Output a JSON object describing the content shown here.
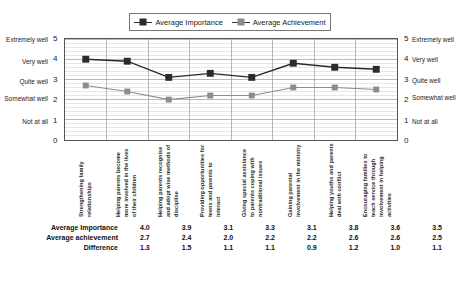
{
  "chart_data": {
    "type": "line",
    "title": "",
    "xlabel": "",
    "ylabel": "",
    "ylim": [
      0,
      5
    ],
    "grid": true,
    "legend_position": "top",
    "categories": [
      "Strengthening family relationships",
      "Helping parents become more involved in the lives of their children",
      "Helping parents recognise and adopt wise methods of discipline",
      "Providing opportunities for teens and parents to interact",
      "Giving special assistance to parents coping with nontraditional issues",
      "Gaining parental involvement in the ministry",
      "Helping youths and parents deal with conflict",
      "Encouraging families to teach service through involvement in helping activities"
    ],
    "series": [
      {
        "name": "Average Importance",
        "values": [
          4.0,
          3.9,
          3.1,
          3.3,
          3.1,
          3.8,
          3.6,
          3.5
        ],
        "color": "#2b2b2b"
      },
      {
        "name": "Average Achievement",
        "values": [
          2.7,
          2.4,
          2.0,
          2.2,
          2.2,
          2.6,
          2.6,
          2.5
        ],
        "color": "#8c8c8c"
      }
    ],
    "y_ticks": [
      {
        "value": 5,
        "number": "5",
        "label": "Extremely well"
      },
      {
        "value": 4,
        "number": "4",
        "label": "Very well"
      },
      {
        "value": 3,
        "number": "3",
        "label": "Quite well"
      },
      {
        "value": 2,
        "number": "2",
        "label": "Somewhat well"
      },
      {
        "value": 1,
        "number": "1",
        "label": "Not at all"
      },
      {
        "value": 0,
        "number": "0",
        "label": ""
      }
    ]
  },
  "legend": {
    "importance_label": "Average Importance",
    "achievement_label": "Average Achievement"
  },
  "axis_left": {
    "t5": "Extremely well",
    "t4": "Very well",
    "t3": "Quite well",
    "t2": "Somewhat well",
    "t1": "Not at all",
    "n5": "5",
    "n4": "4",
    "n3": "3",
    "n2": "2",
    "n1": "1",
    "n0": "0"
  },
  "axis_right": {
    "t5": "Extremely well",
    "t4": "Very well",
    "t3": "Quite well",
    "t2": "Somewhat well",
    "t1": "Not at all",
    "n5": "5",
    "n4": "4",
    "n3": "3",
    "n2": "2",
    "n1": "1",
    "n0": "0"
  },
  "categories": {
    "c0": "Strengthening family relationships",
    "c1": "Helping parents become more involved in the lives of their children",
    "c2": "Helping parents recognise and adopt wise methods of discipline",
    "c3": "Providing opportunities for teens and parents to interact",
    "c4": "Giving special assistance to parents coping with nontraditional issues",
    "c5": "Gaining parental involvement in the ministry",
    "c6": "Helping youths and parents deal with conflict",
    "c7": "Encouraging families to teach service through involvement in helping activities"
  },
  "table": {
    "rows": [
      {
        "label": "Average Importance",
        "values": [
          "4.0",
          "3.9",
          "3.1",
          "3.3",
          "3.1",
          "3.8",
          "3.6",
          "3.5"
        ]
      },
      {
        "label": "Average achievement",
        "values": [
          "2.7",
          "2.4",
          "2.0",
          "2.2",
          "2.2",
          "2.6",
          "2.6",
          "2.5"
        ]
      },
      {
        "label": "Difference",
        "values": [
          "1.3",
          "1.5",
          "1.1",
          "1.1",
          "0.9",
          "1.2",
          "1.0",
          "1.1"
        ]
      }
    ],
    "row0_label": "Average Importance",
    "row1_label": "Average achievement",
    "row2_label": "Difference"
  },
  "colors": {
    "importance": "#2b2b2b",
    "achievement": "#8c8c8c",
    "grid_minor": "#cfcfcf",
    "grid_major": "#9a9a9a",
    "frame": "#555555"
  }
}
